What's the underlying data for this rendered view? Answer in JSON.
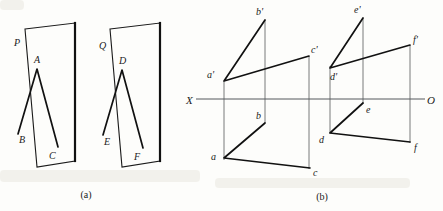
{
  "figure": {
    "background_color": "#fdfdfb",
    "line_color": "#111111",
    "thin_line_color": "#55585c",
    "captions": [
      {
        "id": "caption-a",
        "text": "(a)",
        "x": 86,
        "y": 198
      },
      {
        "id": "caption-b",
        "text": "(b)",
        "x": 322,
        "y": 200
      }
    ]
  },
  "part_a": {
    "name": "pictorial-planes",
    "planes": [
      {
        "id": "plane-P",
        "label": "P",
        "label_x": 14,
        "label_y": 46,
        "outline": "25,29 63,23 75,161 37,167",
        "edge_thick": "75,23 75,161",
        "triangle": {
          "vertices": [
            {
              "id": "A",
              "label": "A",
              "x": 37,
              "y": 69,
              "label_x": 34,
              "label_y": 63
            },
            {
              "id": "B",
              "label": "B",
              "x": 18,
              "y": 134,
              "label_x": 19,
              "label_y": 143
            },
            {
              "id": "C",
              "label": "C",
              "x": 58,
              "y": 147,
              "label_x": 49,
              "label_y": 159
            }
          ]
        }
      },
      {
        "id": "plane-Q",
        "label": "Q",
        "label_x": 99,
        "label_y": 49,
        "outline": "110,29 148,23 160,161 122,167",
        "edge_thick": "160,23 160,161",
        "triangle": {
          "vertices": [
            {
              "id": "D",
              "label": "D",
              "x": 122,
              "y": 70,
              "label_x": 119,
              "label_y": 64
            },
            {
              "id": "E",
              "label": "E",
              "x": 103,
              "y": 135,
              "label_x": 104,
              "label_y": 145
            },
            {
              "id": "F",
              "label": "F",
              "x": 143,
              "y": 148,
              "label_x": 134,
              "label_y": 160
            }
          ]
        }
      }
    ]
  },
  "part_b": {
    "name": "orthographic-projection",
    "axis": {
      "id": "ground-line-XO",
      "x1": 196,
      "x2": 425,
      "y": 99,
      "left_label": "X",
      "left_label_x": 187,
      "left_label_y": 103,
      "right_label": "O",
      "right_label_x": 428,
      "right_label_y": 103
    },
    "groups": [
      {
        "id": "projection-abc",
        "front_view": {
          "id": "front-view-abc",
          "points": [
            {
              "id": "a-prime",
              "label": "a'",
              "x": 224,
              "y": 81,
              "label_x": 209,
              "label_y": 76
            },
            {
              "id": "b-prime",
              "label": "b'",
              "x": 265,
              "y": 20,
              "label_x": 257,
              "label_y": 15
            },
            {
              "id": "c-prime",
              "label": "c'",
              "x": 309,
              "y": 56,
              "label_x": 311,
              "label_y": 53
            }
          ]
        },
        "top_view": {
          "id": "top-view-abc",
          "points": [
            {
              "id": "a",
              "label": "a",
              "x": 224,
              "y": 158,
              "label_x": 212,
              "label_y": 158
            },
            {
              "id": "b",
              "label": "b",
              "x": 265,
              "y": 123,
              "label_x": 256,
              "label_y": 118
            },
            {
              "id": "c",
              "label": "c",
              "x": 310,
              "y": 168,
              "label_x": 314,
              "label_y": 174
            }
          ]
        },
        "projectors": [
          {
            "id": "projector-a",
            "x": 224,
            "y1": 81,
            "y2": 158
          },
          {
            "id": "projector-b",
            "x": 265,
            "y1": 20,
            "y2": 123
          },
          {
            "id": "projector-c",
            "x": 309,
            "y1": 56,
            "y2": 168
          }
        ]
      },
      {
        "id": "projection-def",
        "front_view": {
          "id": "front-view-def",
          "points": [
            {
              "id": "d-prime",
              "label": "d'",
              "x": 330,
              "y": 68,
              "label_x": 331,
              "label_y": 79
            },
            {
              "id": "e-prime",
              "label": "e'",
              "x": 363,
              "y": 18,
              "label_x": 354,
              "label_y": 13
            },
            {
              "id": "f-prime",
              "label": "f'",
              "x": 410,
              "y": 45,
              "label_x": 413,
              "label_y": 43
            }
          ]
        },
        "top_view": {
          "id": "top-view-def",
          "points": [
            {
              "id": "d",
              "label": "d",
              "x": 330,
              "y": 133,
              "label_x": 319,
              "label_y": 141
            },
            {
              "id": "e",
              "label": "e",
              "x": 363,
              "y": 103,
              "label_x": 366,
              "label_y": 112
            },
            {
              "id": "f",
              "label": "f",
              "x": 410,
              "y": 142,
              "label_x": 414,
              "label_y": 150
            }
          ]
        },
        "projectors": [
          {
            "id": "projector-d",
            "x": 330,
            "y1": 68,
            "y2": 133
          },
          {
            "id": "projector-e",
            "x": 363,
            "y1": 18,
            "y2": 103
          },
          {
            "id": "projector-f",
            "x": 410,
            "y1": 45,
            "y2": 142
          }
        ]
      }
    ]
  }
}
